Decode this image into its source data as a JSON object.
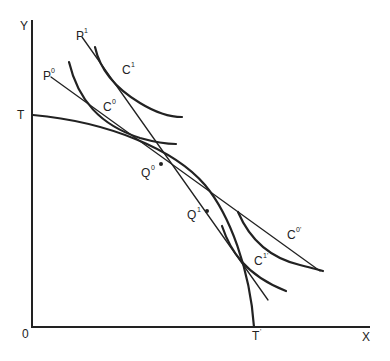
{
  "diagram": {
    "type": "economics-trade-diagram",
    "axes": {
      "x_label": "X",
      "y_label": "Y",
      "origin_label": "0"
    },
    "production_possibility_frontier": {
      "label_start": "T",
      "label_end": "T",
      "label_end_sup": "'"
    },
    "price_lines": [
      {
        "label": "P",
        "sup": "0"
      },
      {
        "label": "P",
        "sup": "1"
      }
    ],
    "indifference_curves": [
      {
        "label": "C",
        "sup": "0"
      },
      {
        "label": "C",
        "sup": "1"
      },
      {
        "label": "C",
        "sup": "0'"
      },
      {
        "label": "C",
        "sup": "1'"
      }
    ],
    "production_points": [
      {
        "label": "Q",
        "sup": "0"
      },
      {
        "label": "Q",
        "sup": "1"
      }
    ]
  }
}
